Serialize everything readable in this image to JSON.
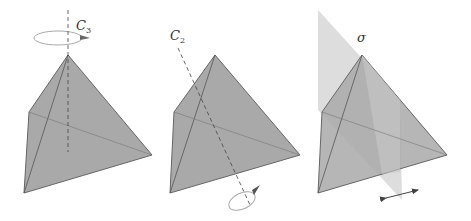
{
  "figure": {
    "panels": [
      {
        "id": "c3",
        "symbol": "C",
        "subscript": "3",
        "operation": "rotation",
        "axis": "vertical through apex"
      },
      {
        "id": "c2",
        "symbol": "C",
        "subscript": "2",
        "operation": "rotation",
        "axis": "through edge midpoints"
      },
      {
        "id": "sigma",
        "symbol": "σ",
        "subscript": "",
        "operation": "reflection",
        "plane": "mirror plane"
      }
    ],
    "colors": {
      "face": "#a9a9a9",
      "edge": "#555555",
      "plane": "#c8c8c8",
      "axis": "#444444"
    }
  }
}
